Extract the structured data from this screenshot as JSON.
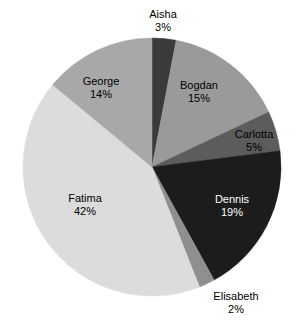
{
  "chart_data": {
    "type": "pie",
    "title": "",
    "subtitle": "",
    "xlabel": "",
    "ylabel": "",
    "legend_position": "none",
    "grid": false,
    "labels_show_percent": true,
    "total_percent": 100,
    "categories": [
      "Aisha",
      "Bogdan",
      "Carlotta",
      "Dennis",
      "Elisabeth",
      "Fatima",
      "George"
    ],
    "values": [
      3,
      15,
      5,
      19,
      2,
      42,
      14
    ],
    "value_labels": [
      "3%",
      "15%",
      "5%",
      "19%",
      "2%",
      "42%",
      "14%"
    ],
    "colors": [
      "#3a3a3a",
      "#9a9a9a",
      "#5c5c5c",
      "#1c1c1c",
      "#8f8f8f",
      "#dcdcdc",
      "#a8a8a8"
    ],
    "slices": [
      {
        "name": "Aisha",
        "percent": 3,
        "percent_label": "3%",
        "color": "#3a3a3a",
        "start_angle": 0,
        "end_angle": 10.8,
        "label_x": 163,
        "label_y": 21,
        "label_color": "#000000"
      },
      {
        "name": "Bogdan",
        "percent": 15,
        "percent_label": "15%",
        "color": "#9a9a9a",
        "start_angle": 10.8,
        "end_angle": 64.8,
        "label_x": 199,
        "label_y": 92,
        "label_color": "#000000"
      },
      {
        "name": "Carlotta",
        "percent": 5,
        "percent_label": "5%",
        "color": "#5c5c5c",
        "start_angle": 64.8,
        "end_angle": 82.8,
        "label_x": 254,
        "label_y": 141,
        "label_color": "#000000"
      },
      {
        "name": "Dennis",
        "percent": 19,
        "percent_label": "19%",
        "color": "#1c1c1c",
        "start_angle": 82.8,
        "end_angle": 151.2,
        "label_x": 232,
        "label_y": 206,
        "label_color": "#ffffff"
      },
      {
        "name": "Elisabeth",
        "percent": 2,
        "percent_label": "2%",
        "color": "#8f8f8f",
        "start_angle": 151.2,
        "end_angle": 158.4,
        "label_x": 236,
        "label_y": 303,
        "label_color": "#000000"
      },
      {
        "name": "Fatima",
        "percent": 42,
        "percent_label": "42%",
        "color": "#dcdcdc",
        "start_angle": 158.4,
        "end_angle": 309.6,
        "label_x": 85,
        "label_y": 205,
        "label_color": "#000000"
      },
      {
        "name": "George",
        "percent": 14,
        "percent_label": "14%",
        "color": "#a8a8a8",
        "start_angle": 309.6,
        "end_angle": 360,
        "label_x": 101,
        "label_y": 88,
        "label_color": "#000000"
      }
    ],
    "geometry": {
      "center_x": 152,
      "center_y": 167,
      "radius": 129,
      "start_angle_offset_deg": 0,
      "direction": "clockwise"
    },
    "background_color": "#ffffff"
  }
}
